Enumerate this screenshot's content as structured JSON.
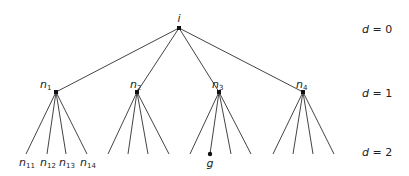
{
  "diagram": {
    "type": "search-tree",
    "colors": {
      "edge": "#444444",
      "node": "#111111",
      "text": "#222222",
      "background": "#ffffff"
    },
    "root": {
      "id": "i",
      "label": "i",
      "x": 179,
      "y": 28
    },
    "level1": [
      {
        "id": "n1",
        "label": "n",
        "sub": "1",
        "x": 56,
        "y": 92
      },
      {
        "id": "n2",
        "label": "n",
        "sub": "2",
        "x": 137,
        "y": 92
      },
      {
        "id": "n3",
        "label": "n",
        "sub": "3",
        "x": 219,
        "y": 92
      },
      {
        "id": "n4",
        "label": "n",
        "sub": "4",
        "x": 303,
        "y": 92
      }
    ],
    "leaves": {
      "n1": [
        {
          "x": 26,
          "label": "n",
          "sub": "11"
        },
        {
          "x": 47,
          "label": "n",
          "sub": "12"
        },
        {
          "x": 66,
          "label": "n",
          "sub": "13"
        },
        {
          "x": 87,
          "label": "n",
          "sub": "14"
        }
      ],
      "n2": [
        {
          "x": 108
        },
        {
          "x": 128
        },
        {
          "x": 148
        },
        {
          "x": 169
        }
      ],
      "n3": [
        {
          "x": 190
        },
        {
          "x": 210,
          "label": "g",
          "goal": true
        },
        {
          "x": 231
        },
        {
          "x": 251
        }
      ],
      "n4": [
        {
          "x": 273
        },
        {
          "x": 293
        },
        {
          "x": 313
        },
        {
          "x": 334
        }
      ]
    },
    "leaf_y": 154,
    "depth_labels": [
      {
        "text": "d = 0",
        "y": 33
      },
      {
        "text": "d = 1",
        "y": 97
      },
      {
        "text": "d = 2",
        "y": 156
      }
    ]
  }
}
